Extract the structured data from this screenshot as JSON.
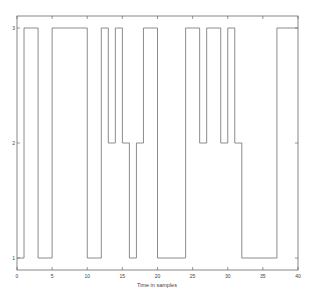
{
  "chart_data": {
    "type": "line",
    "style": "step",
    "title": "",
    "xlabel": "Time in samples",
    "ylabel": "",
    "xlim": [
      0,
      40
    ],
    "ylim": [
      0.9,
      3.1
    ],
    "xticks": [
      0,
      5,
      10,
      15,
      20,
      25,
      30,
      35,
      40
    ],
    "yticks": [
      1,
      2,
      3
    ],
    "grid": false,
    "legend": null,
    "series": [
      {
        "name": "state",
        "x": [
          0,
          1,
          2,
          3,
          4,
          5,
          6,
          7,
          8,
          9,
          10,
          11,
          12,
          13,
          14,
          15,
          16,
          17,
          18,
          19,
          20,
          21,
          22,
          23,
          24,
          25,
          26,
          27,
          28,
          29,
          30,
          31,
          32,
          33,
          34,
          35,
          36,
          37,
          38,
          39
        ],
        "values": [
          1,
          3,
          3,
          1,
          1,
          3,
          3,
          3,
          3,
          3,
          1,
          1,
          3,
          2,
          3,
          2,
          1,
          2,
          3,
          3,
          1,
          1,
          1,
          1,
          3,
          3,
          2,
          3,
          3,
          2,
          3,
          2,
          1,
          1,
          1,
          1,
          1,
          3,
          3,
          3
        ]
      }
    ],
    "color": "#6f6f6f"
  },
  "axes": {
    "x_title": "Time in samples"
  }
}
